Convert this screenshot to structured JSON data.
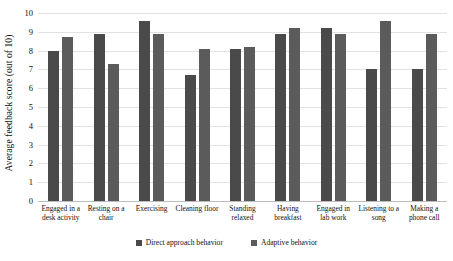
{
  "chart_data": {
    "type": "bar",
    "title": "",
    "xlabel": "",
    "ylabel": "Average feedback score (out of 10)",
    "ylim": [
      0,
      10
    ],
    "ytick_step": 1,
    "yticks": [
      "10",
      "9",
      "8",
      "7",
      "6",
      "5",
      "4",
      "3",
      "2",
      "1",
      "0"
    ],
    "grid": true,
    "legend_position": "bottom-center",
    "categories": [
      "Engaged in a desk activity",
      "Resting on a chair",
      "Exercising",
      "Cleaning floor",
      "Standing relaxed",
      "Having breakfast",
      "Engaged in lab work",
      "Listening to a song",
      "Making a phone call"
    ],
    "series": [
      {
        "name": "Direct approach behavior",
        "color": "#4a4a4a",
        "values": [
          8.0,
          8.9,
          9.6,
          6.7,
          8.1,
          8.9,
          9.2,
          7.0,
          7.0
        ]
      },
      {
        "name": "Adaptive behavior",
        "color": "#5b5b5b",
        "values": [
          8.7,
          7.3,
          8.9,
          8.1,
          8.2,
          9.2,
          8.9,
          9.6,
          8.9
        ]
      }
    ]
  }
}
